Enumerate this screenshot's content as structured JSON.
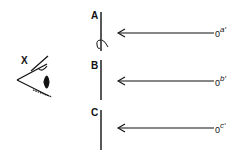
{
  "diagram": {
    "eye_label": "X",
    "screens": [
      {
        "label": "A",
        "source": "0",
        "source_sup": "a′"
      },
      {
        "label": "B",
        "source": "0",
        "source_sup": "b′"
      },
      {
        "label": "C",
        "source": "0",
        "source_sup": "c′"
      }
    ],
    "colors": {
      "ink": "#111111",
      "background": "#ffffff"
    }
  }
}
